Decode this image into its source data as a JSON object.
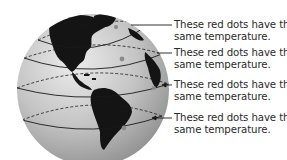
{
  "diagram": {
    "colors": {
      "ocean": "#c8c8c8",
      "land": "#141414",
      "lines": "#1a1a1a",
      "dots": "#8a8a8a",
      "text": "#2a2a2a"
    },
    "annotations": [
      {
        "id": "a1",
        "line1": "These red dots have the",
        "line2": "same temperature.",
        "pointer": "line"
      },
      {
        "id": "a2",
        "line1": "These red dots have the",
        "line2": "same temperature.",
        "pointer": "line"
      },
      {
        "id": "a3",
        "line1": "These red dots have the",
        "line2": "same temperature.",
        "pointer": "arrow"
      },
      {
        "id": "a4",
        "line1": "These red dots have the",
        "line2": "same temperature.",
        "pointer": "line"
      }
    ]
  }
}
